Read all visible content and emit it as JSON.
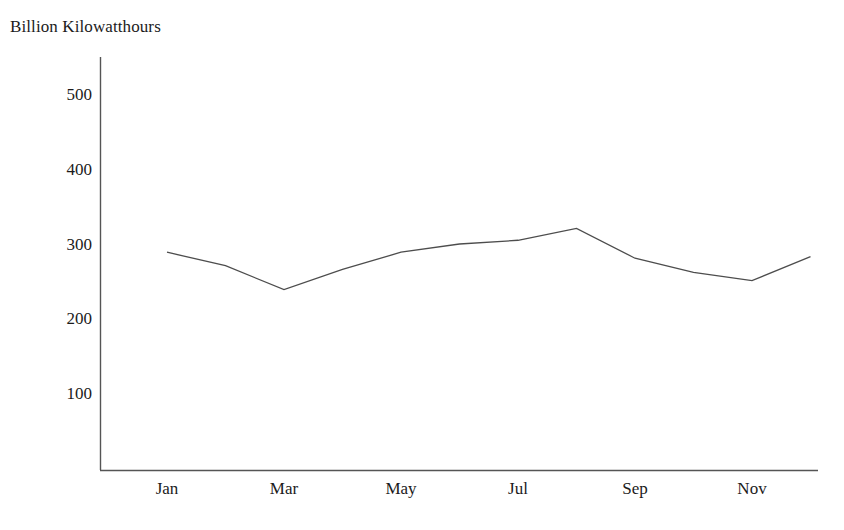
{
  "chart_data": {
    "type": "line",
    "title": "Billion Kilowatthours",
    "subtitle": "",
    "xlabel": "",
    "ylabel": "Billion Kilowatthours",
    "categories": [
      "Jan",
      "Feb",
      "Mar",
      "Apr",
      "May",
      "Jun",
      "Jul",
      "Aug",
      "Sep",
      "Oct",
      "Nov",
      "Dec"
    ],
    "values": [
      291,
      273,
      241,
      268,
      291,
      302,
      307,
      323,
      283,
      264,
      253,
      285
    ],
    "series": [
      {
        "name": "Billion Kilowatthours",
        "values": [
          291,
          273,
          241,
          268,
          291,
          302,
          307,
          323,
          283,
          264,
          253,
          285
        ]
      }
    ],
    "xtick_labels": [
      "Jan",
      "Mar",
      "May",
      "Jul",
      "Sep",
      "Nov"
    ],
    "ytick_labels": [
      "100",
      "200",
      "300",
      "400",
      "500"
    ],
    "yticks": [
      100,
      200,
      300,
      400,
      500
    ],
    "ylim": [
      0,
      560
    ],
    "xlim": [
      0.5,
      12.5
    ],
    "grid": false,
    "legend": false,
    "legend_position": "none",
    "line_color": "#4d4d4d",
    "axis_color": "#555555",
    "background_color": "#ffffff",
    "markers": false
  },
  "axes": {
    "y_axis_name": "y-axis-line",
    "x_axis_name": "x-axis-line"
  }
}
